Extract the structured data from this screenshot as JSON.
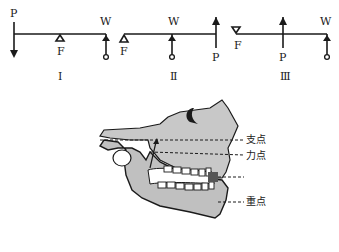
{
  "levers": [
    {
      "class": "I",
      "labels": {
        "P": "P",
        "W": "W",
        "F": "F"
      }
    },
    {
      "class": "II",
      "labels": {
        "P": "P",
        "W": "W",
        "F": "F"
      }
    },
    {
      "class": "III",
      "labels": {
        "P": "P",
        "W": "W",
        "F": "F"
      }
    }
  ],
  "roman": [
    "Ⅰ",
    "Ⅱ",
    "Ⅲ"
  ],
  "jaw": {
    "labels": {
      "fulcrum": "支点",
      "effort": "力点",
      "load": "重点"
    }
  },
  "colors": {
    "line": "#1a1a1a",
    "bone": "#c8c8c8",
    "bone_dark": "#8a8a8a",
    "load_mark": "#555555"
  }
}
